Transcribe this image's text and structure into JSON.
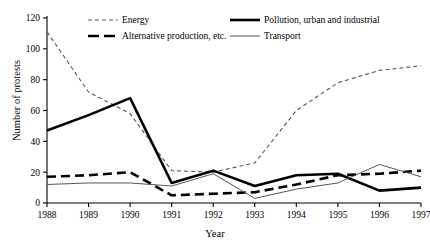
{
  "chart_data": {
    "type": "line",
    "title": "",
    "xlabel": "Year",
    "ylabel": "Number of protests",
    "x": [
      1988,
      1989,
      1990,
      1991,
      1992,
      1993,
      1994,
      1995,
      1996,
      1997
    ],
    "xticklabels": [
      "1988",
      "1989",
      "1990",
      "1991",
      "1992",
      "1993",
      "1994",
      "1995",
      "1996",
      "1997"
    ],
    "yticks": [
      0,
      20,
      40,
      60,
      80,
      100,
      120
    ],
    "yticklabels": [
      "0",
      "20",
      "40",
      "60",
      "80",
      "100",
      "120"
    ],
    "ylim": [
      0,
      120
    ],
    "grid": false,
    "legend_position": "top",
    "series": [
      {
        "name": "Energy",
        "style": "thin-short-dash",
        "color": "#555555",
        "values": [
          111,
          72,
          58,
          21,
          20,
          26,
          60,
          78,
          86,
          89
        ]
      },
      {
        "name": "Alternative production, etc.",
        "style": "thick-long-dash",
        "color": "#000000",
        "values": [
          17,
          18,
          20,
          5,
          6,
          7,
          12,
          18,
          19,
          21
        ]
      },
      {
        "name": "Pollution, urban and industrial",
        "style": "thick-solid",
        "color": "#000000",
        "values": [
          47,
          57,
          68,
          13,
          21,
          11,
          18,
          19,
          8,
          10
        ]
      },
      {
        "name": "Transport",
        "style": "thin-solid",
        "color": "#555555",
        "values": [
          12,
          13,
          13,
          11,
          19,
          3,
          9,
          13,
          25,
          17
        ]
      }
    ]
  },
  "legend": {
    "entries": [
      {
        "label": "Energy"
      },
      {
        "label": "Pollution, urban and industrial"
      },
      {
        "label": "Alternative production, etc."
      },
      {
        "label": "Transport"
      }
    ]
  }
}
